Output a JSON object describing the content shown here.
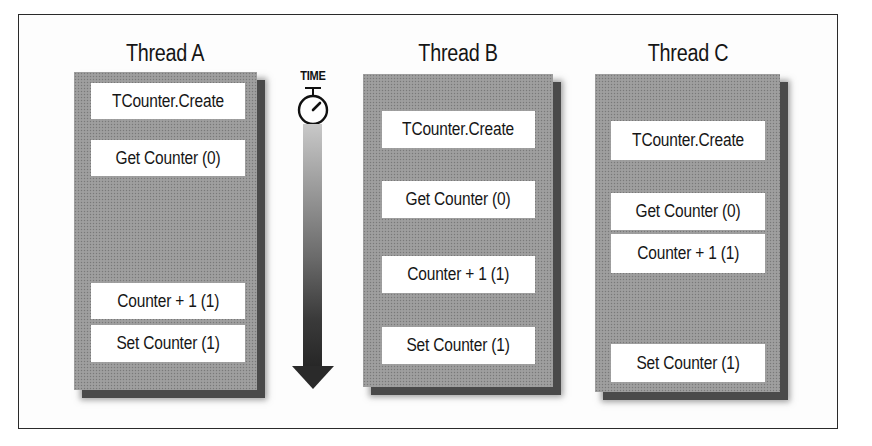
{
  "figure": {
    "time_axis": {
      "label": "TIME",
      "icon": "stopwatch-icon",
      "direction": "down"
    },
    "threads": [
      {
        "title": "Thread A",
        "steps": [
          {
            "label": "TCounter.Create"
          },
          {
            "label": "Get Counter (0)"
          },
          {
            "label": "Counter + 1 (1)"
          },
          {
            "label": "Set Counter (1)"
          }
        ]
      },
      {
        "title": "Thread B",
        "steps": [
          {
            "label": "TCounter.Create"
          },
          {
            "label": "Get Counter (0)"
          },
          {
            "label": "Counter + 1 (1)"
          },
          {
            "label": "Set Counter (1)"
          }
        ]
      },
      {
        "title": "Thread C",
        "steps": [
          {
            "label": "TCounter.Create"
          },
          {
            "label": "Get Counter (0)"
          },
          {
            "label": "Counter + 1 (1)"
          },
          {
            "label": "Set Counter (1)"
          }
        ]
      }
    ],
    "colors": {
      "panel": "#9a9a9a",
      "shadow": "#4a4a4a",
      "step_box": "#ffffff",
      "text": "#161616",
      "frame_border": "#2a2a2a"
    }
  }
}
